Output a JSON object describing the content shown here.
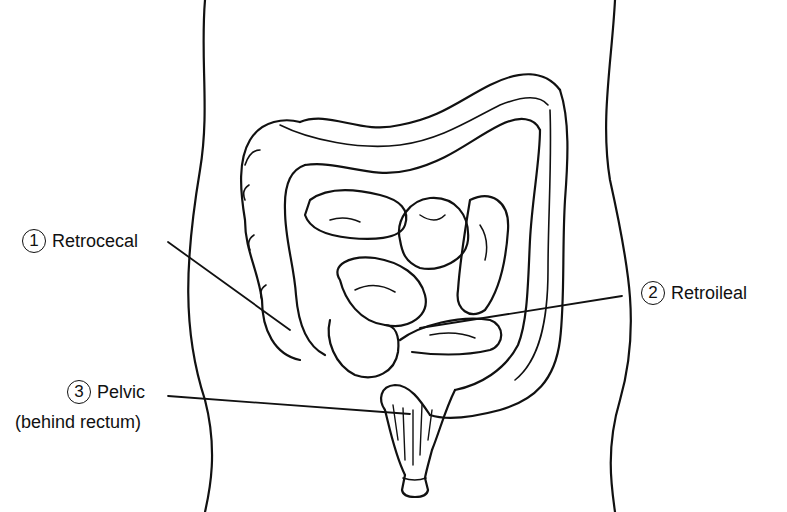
{
  "diagram": {
    "labels": [
      {
        "number": "1",
        "text": "Retrocecal"
      },
      {
        "number": "2",
        "text": "Retroileal"
      },
      {
        "number": "3",
        "text": "Pelvic",
        "subtext": "(behind rectum)"
      }
    ],
    "colors": {
      "line": "#111111",
      "background": "#ffffff"
    }
  }
}
